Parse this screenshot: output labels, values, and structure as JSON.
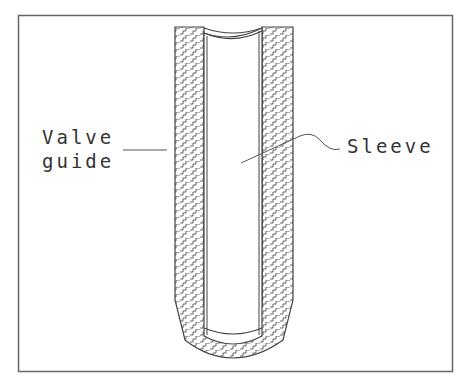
{
  "diagram": {
    "type": "cross-section",
    "labels": {
      "valve_guide_line1": "Valve",
      "valve_guide_line2": "guide",
      "sleeve": "Sleeve"
    },
    "colors": {
      "line": "#444444",
      "frame": "#666666",
      "background": "#ffffff"
    }
  }
}
